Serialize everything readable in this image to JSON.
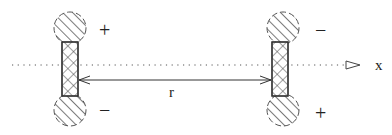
{
  "diagram": {
    "axis": {
      "label": "x",
      "style": "dotted",
      "arrowhead": "hollow-triangle"
    },
    "separation": {
      "label": "r",
      "style": "double-arrow"
    },
    "left_dipole": {
      "top_sign": "+",
      "bottom_sign": "−",
      "body": "cross-hatched rectangle",
      "end_caps": "diagonal-hatched circles"
    },
    "right_dipole": {
      "top_sign": "−",
      "bottom_sign": "+",
      "body": "cross-hatched rectangle",
      "end_caps": "diagonal-hatched circles"
    },
    "colors": {
      "stroke": "#333333",
      "background": "#ffffff"
    }
  }
}
